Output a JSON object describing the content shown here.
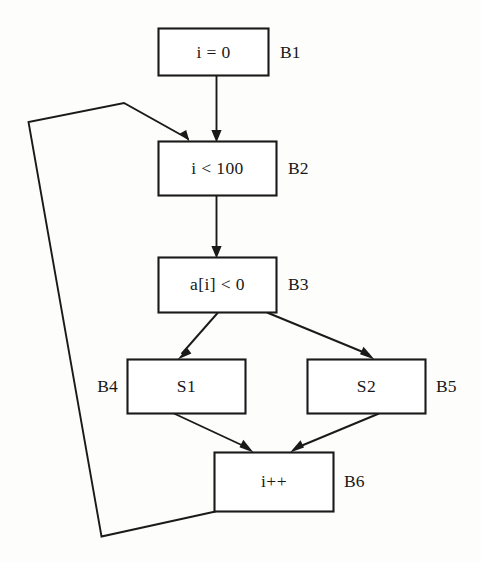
{
  "figure": {
    "kind": "control-flow-graph",
    "background_color": "#fdfdfc",
    "line_color": "#1a1a1a",
    "text_color": "#181818",
    "width": 481,
    "height": 562
  },
  "nodes": [
    {
      "id": "B1",
      "code": "i = 0",
      "label": "B1",
      "label_side": "right"
    },
    {
      "id": "B2",
      "code": "i < 100",
      "label": "B2",
      "label_side": "right"
    },
    {
      "id": "B3",
      "code": "a[i] < 0",
      "label": "B3",
      "label_side": "right"
    },
    {
      "id": "B4",
      "code": "S1",
      "label": "B4",
      "label_side": "left"
    },
    {
      "id": "B5",
      "code": "S2",
      "label": "B5",
      "label_side": "right"
    },
    {
      "id": "B6",
      "code": "i++",
      "label": "B6",
      "label_side": "right"
    }
  ],
  "edges": [
    {
      "from": "B1",
      "to": "B2",
      "kind": "straight"
    },
    {
      "from": "B2",
      "to": "B3",
      "kind": "straight"
    },
    {
      "from": "B3",
      "to": "B4",
      "kind": "diagonal-left"
    },
    {
      "from": "B3",
      "to": "B5",
      "kind": "diagonal-right"
    },
    {
      "from": "B4",
      "to": "B6",
      "kind": "diagonal-right"
    },
    {
      "from": "B5",
      "to": "B6",
      "kind": "diagonal-left"
    },
    {
      "from": "B6",
      "to": "B2",
      "kind": "back-edge"
    }
  ]
}
